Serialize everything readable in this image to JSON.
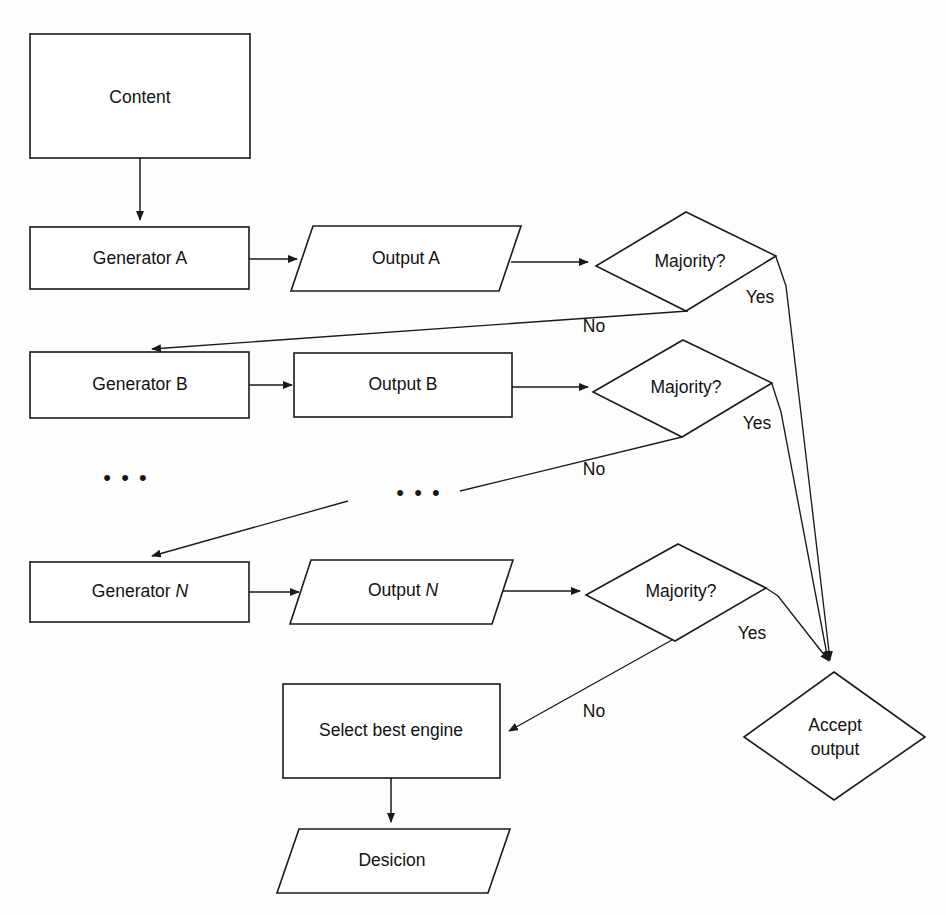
{
  "diagram": {
    "type": "flowchart",
    "background_color": "#fdfdfc",
    "stroke_color": "#1a1a1a",
    "nodes": [
      {
        "id": "content",
        "label": "Content",
        "shape": "rectangle"
      },
      {
        "id": "generator_a",
        "label": "Generator A",
        "shape": "rectangle"
      },
      {
        "id": "output_a",
        "label": "Output A",
        "shape": "parallelogram"
      },
      {
        "id": "majority_a",
        "label": "Majority?",
        "shape": "diamond"
      },
      {
        "id": "generator_b",
        "label": "Generator B",
        "shape": "rectangle"
      },
      {
        "id": "output_b",
        "label": "Output B",
        "shape": "rectangle"
      },
      {
        "id": "majority_b",
        "label": "Majority?",
        "shape": "diamond"
      },
      {
        "id": "generator_n",
        "label_prefix": "Generator ",
        "label_italic": "N",
        "label": "Generator N",
        "shape": "rectangle"
      },
      {
        "id": "output_n",
        "label_prefix": "Output ",
        "label_italic": "N",
        "label": "Output N",
        "shape": "parallelogram"
      },
      {
        "id": "majority_n",
        "label": "Majority?",
        "shape": "diamond"
      },
      {
        "id": "select_best",
        "label": "Select best engine",
        "shape": "rectangle"
      },
      {
        "id": "desicion",
        "label": "Desicion",
        "shape": "parallelogram"
      },
      {
        "id": "accept_output",
        "label_line1": "Accept",
        "label_line2": "output",
        "label": "Accept output",
        "shape": "diamond"
      }
    ],
    "edge_labels": {
      "yes_a": "Yes",
      "no_a": "No",
      "yes_b": "Yes",
      "no_b": "No",
      "yes_n": "Yes",
      "no_n": "No"
    },
    "ellipses": {
      "left": "• • •",
      "middle": "• • •"
    }
  }
}
